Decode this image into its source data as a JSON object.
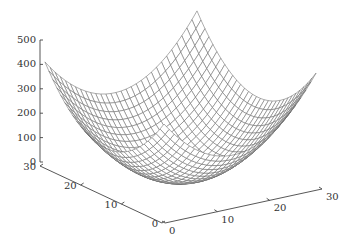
{
  "chart_data": {
    "type": "surface",
    "title": "",
    "function": "z = (x-15)^2 + (y-15)^2",
    "x": {
      "label": "",
      "range": [
        0,
        30
      ],
      "ticks": [
        0,
        10,
        20,
        30
      ]
    },
    "y": {
      "label": "",
      "range": [
        0,
        30
      ],
      "ticks": [
        0,
        10,
        20,
        30
      ]
    },
    "z": {
      "label": "",
      "range": [
        0,
        500
      ],
      "ticks": [
        0,
        100,
        200,
        300,
        400,
        500
      ]
    },
    "grid_step": 1,
    "corner_values": {
      "(0,0)": 450,
      "(30,0)": 450,
      "(0,30)": 450,
      "(30,30)": 450
    },
    "minimum": {
      "x": 15,
      "y": 15,
      "z": 0
    },
    "grid": false,
    "legend": null,
    "colors": {
      "mesh": "#6b6b6b",
      "axis": "#444444",
      "text": "#333333",
      "background": "#ffffff"
    }
  },
  "projection": {
    "origin": [
      164,
      124
    ],
    "x_unit": [
      5.07,
      -1.7
    ],
    "y_unit": [
      -3.97,
      -2.07
    ],
    "z_unit": -0.243,
    "z_ref": 450
  },
  "axes": {
    "z_axis": {
      "x": 40,
      "y0": 162,
      "y500": 40,
      "tick_labels": [
        "0",
        "100",
        "200",
        "300",
        "400",
        "500"
      ]
    },
    "y_axis": {
      "start": [
        40,
        166
      ],
      "end": [
        162,
        223
      ],
      "tick_labels": [
        "30",
        "20",
        "10",
        "0"
      ]
    },
    "x_axis": {
      "start": [
        165,
        223
      ],
      "end": [
        322,
        189
      ],
      "tick_labels": [
        "0",
        "10",
        "20",
        "30"
      ]
    }
  }
}
